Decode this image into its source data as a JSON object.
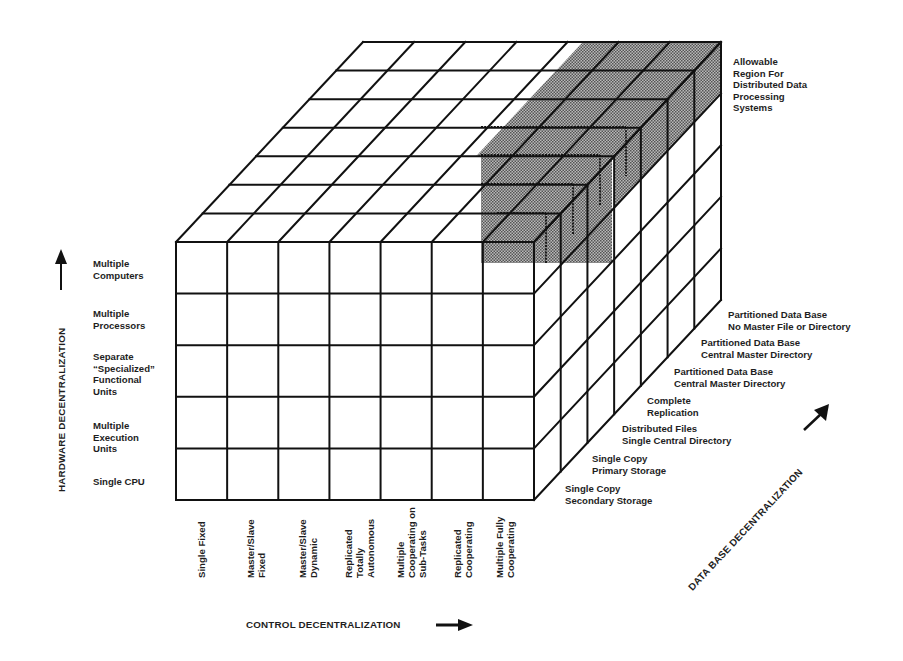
{
  "diagram": {
    "grid": {
      "columns": 7,
      "rows": 5,
      "depth_layers": 7
    },
    "colors": {
      "line": "#111111",
      "shade": "#8a8a8a",
      "background": "#ffffff"
    },
    "shaded_region_label": "Allowable\nRegion For\nDistributed Data\nProcessing\nSystems",
    "hardware_axis": {
      "title": "HARDWARE DECENTRALIZATION",
      "arrow": "arrow-up",
      "levels": [
        "Single CPU",
        "Multiple\nExecution\nUnits",
        "Separate\n“Specialized”\nFunctional\nUnits",
        "Multiple\nProcessors",
        "Multiple\nComputers"
      ]
    },
    "control_axis": {
      "title": "CONTROL DECENTRALIZATION",
      "arrow": "arrow-right",
      "levels": [
        "Single Fixed",
        "Master/Slave\nFixed",
        "Master/Slave\nDynamic",
        "Replicated\nTotally\nAutonomous",
        "Multiple\nCooperating on\nSub-Tasks",
        "Replicated\nCooperating",
        "Multiple Fully\nCooperating"
      ]
    },
    "database_axis": {
      "title": "DATA BASE DECENTRALIZATION",
      "arrow": "arrow-up-right",
      "levels": [
        "Single Copy\nSecondary Storage",
        "Single Copy\nPrimary Storage",
        "Distributed Files\nSingle Central Directory",
        "Complete\nReplication",
        "Partitioned Data Base\nCentral Master Directory",
        "Partitioned Data Base\nCentral Master Directory",
        "Partitioned Data Base\nNo Master File or Directory"
      ]
    }
  }
}
